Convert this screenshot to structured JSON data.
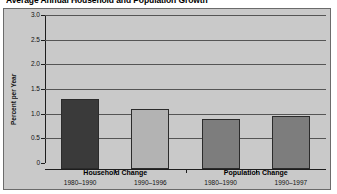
{
  "chart_data": {
    "type": "bar",
    "title": "Average Annual Household and Population Growth",
    "xlabel": "",
    "ylabel": "Percent per Year",
    "ylim": [
      0,
      3.0
    ],
    "yticks": [
      "0",
      "0.5",
      "1.0",
      "1.5",
      "2.0",
      "2.5",
      "3.0"
    ],
    "ytick_values": [
      0,
      0.5,
      1.0,
      1.5,
      2.0,
      2.5,
      3.0
    ],
    "grid": true,
    "legend": "none",
    "groups": [
      {
        "name": "Household Change",
        "categories": [
          "1980–1990",
          "1990–1996"
        ]
      },
      {
        "name": "Population Change",
        "categories": [
          "1980–1990",
          "1990–1997"
        ]
      }
    ],
    "categories": [
      "1980–1990",
      "1990–1996",
      "1980–1990",
      "1990–1997"
    ],
    "values": [
      1.4,
      1.2,
      1.0,
      1.05
    ],
    "bar_colors": [
      "#3a3a3a",
      "#b3b3b3",
      "#7d7d7d",
      "#7d7d7d"
    ]
  },
  "style": {
    "panel_background": "#c9c9c9",
    "page_background": "#ffffff",
    "grid_color": "#555555",
    "axis_color": "#1d1d1d",
    "frame_color": "#6b6b6b"
  }
}
